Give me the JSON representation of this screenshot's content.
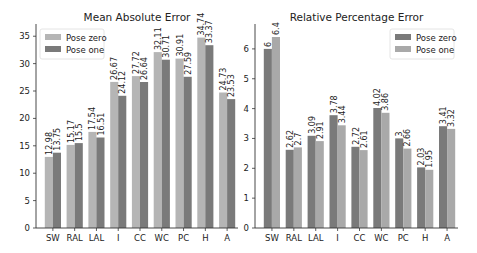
{
  "chart_data": [
    {
      "type": "bar",
      "title": "Mean Absolute Error",
      "xlabel": "",
      "ylabel": "",
      "categories": [
        "SW",
        "RAL",
        "LAL",
        "I",
        "CC",
        "WC",
        "PC",
        "H",
        "A"
      ],
      "series": [
        {
          "name": "Pose zero",
          "color": "#b5b5b5",
          "values": [
            12.98,
            15.17,
            17.54,
            26.67,
            27.72,
            32.11,
            30.91,
            34.74,
            24.73
          ]
        },
        {
          "name": "Pose one",
          "color": "#7a7a7a",
          "values": [
            13.75,
            15.5,
            16.51,
            24.12,
            26.64,
            30.71,
            27.59,
            33.37,
            23.53
          ]
        }
      ],
      "yticks": [
        0,
        5,
        10,
        15,
        20,
        25,
        30,
        35
      ],
      "ylim": [
        0,
        36.5
      ],
      "grid": false,
      "legend_position": "upper left",
      "data_labels": true
    },
    {
      "type": "bar",
      "title": "Relative Percentage Error",
      "xlabel": "",
      "ylabel": "",
      "categories": [
        "SW",
        "RAL",
        "LAL",
        "I",
        "CC",
        "WC",
        "PC",
        "H",
        "A"
      ],
      "series": [
        {
          "name": "Pose zero",
          "color": "#7a7a7a",
          "values": [
            6,
            2.62,
            3.09,
            3.78,
            2.72,
            4.02,
            3,
            2.03,
            3.41
          ]
        },
        {
          "name": "Pose one",
          "color": "#a9a9a9",
          "values": [
            6.4,
            2.7,
            2.91,
            3.44,
            2.61,
            3.86,
            2.66,
            1.95,
            3.32
          ]
        }
      ],
      "yticks": [
        0,
        1,
        2,
        3,
        4,
        5,
        6
      ],
      "ylim": [
        0,
        6.7
      ],
      "grid": false,
      "legend_position": "upper right",
      "data_labels": true
    }
  ]
}
